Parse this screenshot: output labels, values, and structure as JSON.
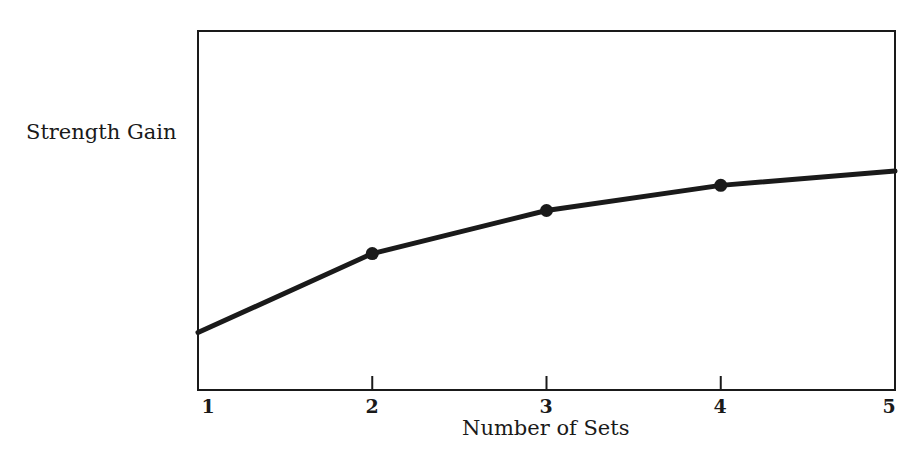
{
  "chart_data": {
    "type": "line",
    "title": "",
    "xlabel": "Number of Sets",
    "ylabel": "Strength Gain",
    "x": [
      1,
      2,
      3,
      4,
      5
    ],
    "x_tick_labels": [
      "1",
      "2",
      "3",
      "4",
      "5"
    ],
    "y_tick_labels": [],
    "ylim": [
      0,
      100
    ],
    "y_units_note": "unlabeled relative scale (0 = bottom of frame, 100 = top)",
    "series": [
      {
        "name": "Strength Gain",
        "values": [
          16,
          38,
          50,
          57,
          61
        ],
        "markers_at": [
          2,
          3,
          4
        ],
        "color": "#1a1a1a"
      }
    ],
    "grid": false,
    "legend": null
  },
  "labels": {
    "ylabel": "Strength Gain",
    "xlabel": "Number of Sets",
    "ticks": [
      "1",
      "2",
      "3",
      "4",
      "5"
    ]
  }
}
